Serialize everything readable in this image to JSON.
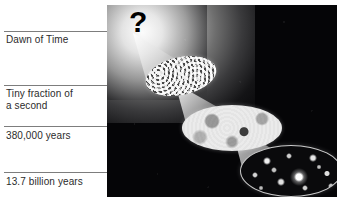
{
  "figure": {
    "panel": {
      "background_color": "#050507",
      "glow_color": "#f2f2f2"
    },
    "unknown_marker": {
      "glyph": "?",
      "name": "question-mark"
    }
  },
  "timeline": {
    "labels": [
      {
        "id": "dawn-of-time",
        "text": "Dawn of Time"
      },
      {
        "id": "tiny-fraction",
        "text": "Tiny fraction of\na second"
      },
      {
        "id": "recombination",
        "text": "380,000 years"
      },
      {
        "id": "present-day",
        "text": "13.7 billion years"
      }
    ]
  },
  "stages": [
    {
      "id": "quantum-foam",
      "name": "quantum-foam-oval"
    },
    {
      "id": "cmb-map",
      "name": "cosmic-microwave-background-oval"
    },
    {
      "id": "galaxies",
      "name": "galaxies-oval"
    }
  ],
  "colors": {
    "label_text": "#2b2b2b",
    "leader_line": "#7d7d7d",
    "cone_light": "#d9d9d9",
    "page_background": "#ffffff"
  }
}
